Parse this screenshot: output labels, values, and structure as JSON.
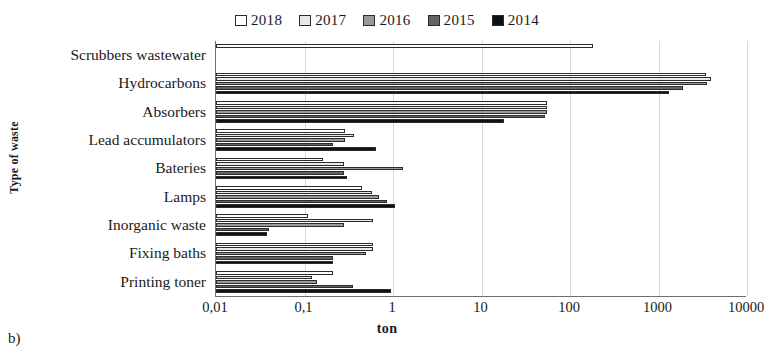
{
  "figure_label": "b)",
  "legend": {
    "position": "top-center",
    "entries": [
      {
        "label": "2018",
        "color": "#ffffff",
        "icon": "square-swatch"
      },
      {
        "label": "2017",
        "color": "#e8e8e8",
        "icon": "square-swatch"
      },
      {
        "label": "2016",
        "color": "#9a9a9a",
        "icon": "square-swatch"
      },
      {
        "label": "2015",
        "color": "#636363",
        "icon": "square-swatch"
      },
      {
        "label": "2014",
        "color": "#111111",
        "icon": "square-swatch"
      }
    ]
  },
  "axes": {
    "x_title": "ton",
    "y_title": "Type of waste",
    "x_ticks": [
      "0,01",
      "0,1",
      "1",
      "10",
      "100",
      "1000",
      "10000"
    ],
    "x_tick_values": [
      0.01,
      0.1,
      1,
      10,
      100,
      1000,
      10000
    ]
  },
  "chart_data": {
    "type": "bar",
    "orientation": "horizontal",
    "title": "",
    "xlabel": "ton",
    "ylabel": "Type of waste",
    "xscale": "log",
    "xlim": [
      0.01,
      10000
    ],
    "grid": true,
    "legend_position": "top-center",
    "tick_labels": [
      "0,01",
      "0,1",
      "1",
      "10",
      "100",
      "1000",
      "10000"
    ],
    "categories": [
      "Scrubbers wastewater",
      "Hydrocarbons",
      "Absorbers",
      "Lead accumulators",
      "Bateries",
      "Lamps",
      "Inorganic waste",
      "Fixing baths",
      "Printing toner"
    ],
    "series": [
      {
        "name": "2018",
        "color": "#ffffff",
        "values": [
          180,
          3400,
          55,
          0.29,
          0.16,
          0.45,
          0.11,
          0.6,
          0.21
        ]
      },
      {
        "name": "2017",
        "color": "#e8e8e8",
        "values": [
          null,
          3900,
          55,
          0.36,
          0.28,
          0.58,
          0.6,
          0.6,
          0.12
        ]
      },
      {
        "name": "2016",
        "color": "#9a9a9a",
        "values": [
          null,
          3500,
          55,
          0.29,
          1.3,
          0.7,
          0.28,
          0.5,
          0.14
        ]
      },
      {
        "name": "2015",
        "color": "#636363",
        "values": [
          null,
          1900,
          52,
          0.21,
          0.28,
          0.85,
          0.04,
          0.21,
          0.35
        ]
      },
      {
        "name": "2014",
        "color": "#111111",
        "values": [
          null,
          1300,
          18,
          0.65,
          0.3,
          1.05,
          0.038,
          0.21,
          0.95
        ]
      }
    ]
  }
}
